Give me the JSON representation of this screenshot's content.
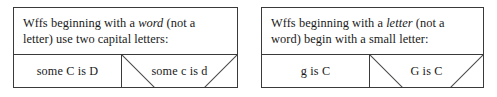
{
  "figure": {
    "panels": [
      {
        "id": "word",
        "rule": {
          "before_em": "Wffs beginning with a ",
          "em": "word",
          "after_em": " (not a letter) use two capital letters:"
        },
        "examples": {
          "good": {
            "label": "some C is D",
            "status": "allowed"
          },
          "bad": {
            "label": "some c is d",
            "status": "crossed-out"
          }
        }
      },
      {
        "id": "letter",
        "rule": {
          "before_em": "Wffs beginning with a ",
          "em": "letter",
          "after_em": " (not a word) begin with a small letter:"
        },
        "examples": {
          "good": {
            "label": "g is C",
            "status": "allowed"
          },
          "bad": {
            "label": "G is C",
            "status": "crossed-out"
          }
        }
      }
    ]
  },
  "colors": {
    "ink": "#1a1a1a",
    "rule_line": "#3a3a3a",
    "cross_line": "#4a4a4a",
    "background": "#ffffff"
  }
}
